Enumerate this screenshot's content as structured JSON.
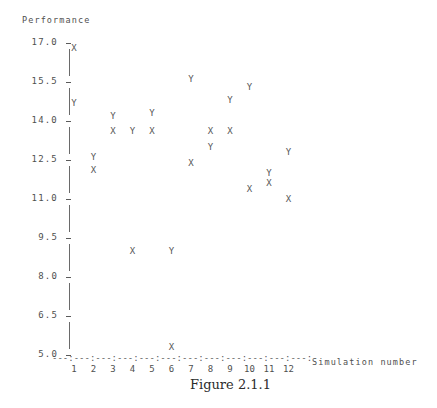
{
  "figure": {
    "caption": "Figure 2.1.1"
  },
  "axes": {
    "y_title": "Performance",
    "x_title": "Simulation number",
    "y_tick_labels": [
      "17.0",
      "15.5",
      "14.0",
      "12.5",
      "11.0",
      "9.5",
      "8.0",
      "6.5",
      "5.0"
    ],
    "x_tick_labels": [
      "1",
      "2",
      "3",
      "4",
      "5",
      "6",
      "7",
      "8",
      "9",
      "10",
      "11",
      "12"
    ],
    "axis_rule": "---:---:---:---:---:---:---:---:---:---:---:---:",
    "tick_dash": "-"
  },
  "colors": {
    "ink": "#4f4f4f",
    "marker": "#555555",
    "axis": "#5a5a5a",
    "caption": "#2c2c2c",
    "background": "#ffffff"
  },
  "chart_data": {
    "type": "scatter",
    "title": "Figure 2.1.1",
    "xlabel": "Simulation number",
    "ylabel": "Performance",
    "xlim": [
      0.4,
      12.6
    ],
    "ylim": [
      5.0,
      17.0
    ],
    "grid": false,
    "legend": "none",
    "marker_glyphs": {
      "X": "X",
      "Y": "Y"
    },
    "x": [
      1,
      2,
      3,
      4,
      5,
      6,
      7,
      8,
      9,
      10,
      11,
      12
    ],
    "yticks": [
      5.0,
      6.5,
      8.0,
      9.5,
      11.0,
      12.5,
      14.0,
      15.5,
      17.0
    ],
    "series": [
      {
        "name": "X",
        "glyph": "X",
        "values": [
          16.8,
          12.1,
          13.6,
          9.0,
          13.6,
          5.3,
          12.4,
          13.6,
          13.6,
          11.4,
          11.6,
          11.0
        ]
      },
      {
        "name": "Y",
        "glyph": "Y",
        "values": [
          14.7,
          12.6,
          14.2,
          13.6,
          14.3,
          9.0,
          15.6,
          13.0,
          14.8,
          15.3,
          12.0,
          12.8
        ]
      }
    ],
    "points": [
      {
        "sim": 1,
        "series": "X",
        "value": 16.8
      },
      {
        "sim": 1,
        "series": "Y",
        "value": 14.7
      },
      {
        "sim": 2,
        "series": "Y",
        "value": 12.6
      },
      {
        "sim": 2,
        "series": "X",
        "value": 12.1
      },
      {
        "sim": 3,
        "series": "Y",
        "value": 14.2
      },
      {
        "sim": 3,
        "series": "X",
        "value": 13.6
      },
      {
        "sim": 4,
        "series": "Y",
        "value": 13.6
      },
      {
        "sim": 4,
        "series": "X",
        "value": 9.0
      },
      {
        "sim": 5,
        "series": "Y",
        "value": 14.3
      },
      {
        "sim": 5,
        "series": "X",
        "value": 13.6
      },
      {
        "sim": 6,
        "series": "Y",
        "value": 9.0
      },
      {
        "sim": 6,
        "series": "X",
        "value": 5.3
      },
      {
        "sim": 7,
        "series": "Y",
        "value": 15.6
      },
      {
        "sim": 7,
        "series": "X",
        "value": 12.4
      },
      {
        "sim": 8,
        "series": "Y",
        "value": 13.0
      },
      {
        "sim": 8,
        "series": "X",
        "value": 13.6
      },
      {
        "sim": 9,
        "series": "Y",
        "value": 14.8
      },
      {
        "sim": 9,
        "series": "X",
        "value": 13.6
      },
      {
        "sim": 10,
        "series": "Y",
        "value": 15.3
      },
      {
        "sim": 10,
        "series": "X",
        "value": 11.4
      },
      {
        "sim": 11,
        "series": "Y",
        "value": 12.0
      },
      {
        "sim": 11,
        "series": "X",
        "value": 11.6
      },
      {
        "sim": 12,
        "series": "Y",
        "value": 12.8
      },
      {
        "sim": 12,
        "series": "X",
        "value": 11.0
      }
    ]
  }
}
